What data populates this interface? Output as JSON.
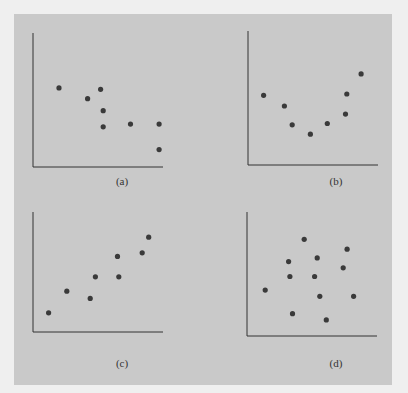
{
  "figure": {
    "panels": [
      {
        "id": "a",
        "label": "(a)"
      },
      {
        "id": "b",
        "label": "(b)"
      },
      {
        "id": "c",
        "label": "(c)"
      },
      {
        "id": "d",
        "label": "(d)"
      }
    ]
  },
  "chart_data": [
    {
      "type": "scatter",
      "title": "(a)",
      "xlabel": "",
      "ylabel": "",
      "grid": false,
      "description": "negative relationship",
      "x": [
        2.0,
        4.2,
        5.2,
        5.4,
        5.4,
        7.5,
        9.7,
        9.7
      ],
      "y": [
        5.9,
        5.1,
        5.8,
        4.2,
        3.0,
        3.2,
        3.2,
        1.3
      ],
      "xlim": [
        0,
        10
      ],
      "ylim": [
        0,
        10
      ]
    },
    {
      "type": "scatter",
      "title": "(b)",
      "xlabel": "",
      "ylabel": "",
      "grid": false,
      "description": "curvilinear (U-shaped) relationship",
      "x": [
        1.2,
        2.8,
        3.4,
        4.8,
        6.1,
        7.5,
        7.6,
        8.7
      ],
      "y": [
        5.2,
        4.4,
        3.0,
        2.3,
        3.1,
        3.8,
        5.3,
        6.8
      ],
      "xlim": [
        0,
        10
      ],
      "ylim": [
        0,
        10
      ]
    },
    {
      "type": "scatter",
      "title": "(c)",
      "xlabel": "",
      "ylabel": "",
      "grid": false,
      "description": "positive relationship",
      "x": [
        1.2,
        2.6,
        4.4,
        4.8,
        6.5,
        6.6,
        8.4,
        8.9
      ],
      "y": [
        1.6,
        3.4,
        2.8,
        4.6,
        6.3,
        4.6,
        6.6,
        7.9
      ],
      "xlim": [
        0,
        10
      ],
      "ylim": [
        0,
        10
      ]
    },
    {
      "type": "scatter",
      "title": "(d)",
      "xlabel": "",
      "ylabel": "",
      "grid": false,
      "description": "no relationship",
      "x": [
        1.4,
        3.2,
        3.3,
        3.5,
        4.4,
        5.2,
        5.4,
        5.6,
        6.1,
        7.4,
        7.7,
        8.2
      ],
      "y": [
        3.7,
        6.0,
        4.8,
        1.8,
        7.8,
        4.8,
        6.3,
        3.2,
        1.3,
        5.5,
        7.0,
        3.2
      ],
      "xlim": [
        0,
        10
      ],
      "ylim": [
        0,
        10
      ]
    }
  ]
}
